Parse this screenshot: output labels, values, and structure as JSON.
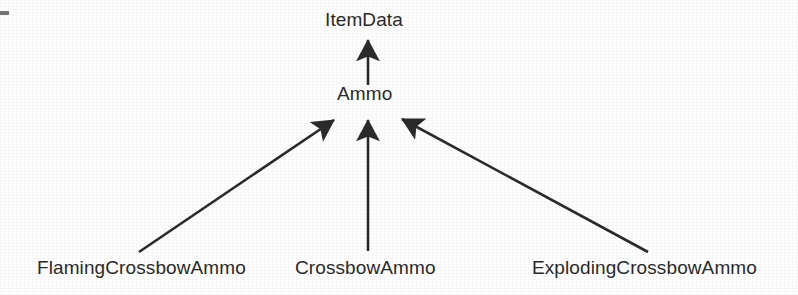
{
  "figure": {
    "kind": "class-inheritance-diagram",
    "notation": "uml-generalization",
    "background_color": "#ffffff",
    "ink_color": "#2b2b2b"
  },
  "nodes": {
    "root": {
      "id": "ItemData",
      "label": "ItemData",
      "level": 0
    },
    "middle": {
      "id": "Ammo",
      "label": "Ammo",
      "level": 1
    },
    "leaves": [
      {
        "id": "FlamingCrossbowAmmo",
        "label": "FlamingCrossbowAmmo",
        "level": 2,
        "position": "left"
      },
      {
        "id": "CrossbowAmmo",
        "label": "CrossbowAmmo",
        "level": 2,
        "position": "center"
      },
      {
        "id": "ExplodingCrossbowAmmo",
        "label": "ExplodingCrossbowAmmo",
        "level": 2,
        "position": "right"
      }
    ]
  },
  "edges": [
    {
      "name": "ammo-to-itemdata",
      "from": "Ammo",
      "to": "ItemData",
      "relation": "inherits",
      "x1": 368,
      "y1": 85,
      "x2": 368,
      "y2": 36
    },
    {
      "name": "flamingcrossbowammo-to-ammo",
      "from": "FlamingCrossbowAmmo",
      "to": "Ammo",
      "relation": "inherits",
      "x1": 139,
      "y1": 252,
      "x2": 337,
      "y2": 116
    },
    {
      "name": "crossbowammo-to-ammo",
      "from": "CrossbowAmmo",
      "to": "Ammo",
      "relation": "inherits",
      "x1": 368,
      "y1": 251,
      "x2": 368,
      "y2": 116
    },
    {
      "name": "explodingcrossbowammo-to-ammo",
      "from": "ExplodingCrossbowAmmo",
      "to": "Ammo",
      "relation": "inherits",
      "x1": 648,
      "y1": 252,
      "x2": 399,
      "y2": 116
    }
  ],
  "artifact": {
    "name": "scan-edge-mark",
    "description": "scan-artifact-dash"
  }
}
